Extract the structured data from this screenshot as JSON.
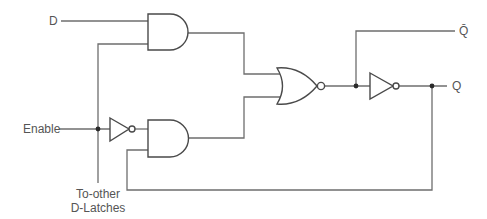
{
  "diagram": {
    "colors": {
      "wire": "#6e6e6e",
      "gate": "#4a4a4a",
      "text": "#555555",
      "background": "#ffffff"
    },
    "labels": {
      "input_d": "D",
      "input_enable": "Enable",
      "fanout_line1": "To-other",
      "fanout_line2": "D-Latches",
      "output_q": "Q",
      "output_qbar": "Q̄"
    },
    "components": [
      {
        "id": "and-top",
        "type": "AND",
        "inputs": [
          "D",
          "Enable"
        ]
      },
      {
        "id": "inverter-enable",
        "type": "NOT",
        "inputs": [
          "Enable"
        ]
      },
      {
        "id": "and-bottom",
        "type": "AND",
        "inputs": [
          "NOT Enable",
          "Q (feedback)"
        ]
      },
      {
        "id": "nor",
        "type": "NOR",
        "inputs": [
          "and-top",
          "and-bottom"
        ],
        "output": "Q̄"
      },
      {
        "id": "inverter-output",
        "type": "NOT",
        "inputs": [
          "Q̄"
        ],
        "output": "Q"
      }
    ]
  }
}
